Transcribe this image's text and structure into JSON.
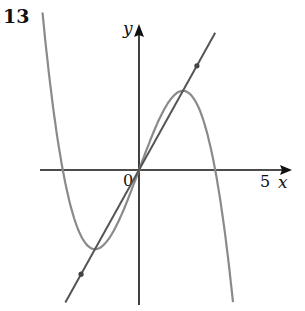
{
  "question_number": "13",
  "chart_data": {
    "type": "line",
    "title": "",
    "xlabel": "x",
    "ylabel": "y",
    "origin_label": "0",
    "x_tick_labels": [
      {
        "value": 5,
        "label": "5"
      }
    ],
    "xlim": [
      -3.8,
      5.9
    ],
    "ylim": [
      -5.3,
      5.6
    ],
    "grid": false,
    "series": [
      {
        "name": "cubic curve",
        "kind": "cubic",
        "roots": [
          -3,
          0,
          3
        ],
        "equation_form": "y = a·x(9 - x²)",
        "a": 0.3,
        "x_range": [
          -3.8,
          5.0
        ],
        "color": "#8a8a8a"
      },
      {
        "name": "straight line",
        "kind": "line",
        "slope": 1.8,
        "intercept": 0,
        "x_range": [
          -2.9,
          3.0
        ],
        "color": "#555555"
      }
    ],
    "intersection_points": [
      {
        "x": -2.28,
        "y": -4.1
      },
      {
        "x": 0,
        "y": 0
      },
      {
        "x": 2.28,
        "y": 4.1
      }
    ]
  },
  "colors": {
    "axis": "#111111",
    "curve": "#8a8a8a",
    "line": "#555555",
    "point": "#444444"
  }
}
